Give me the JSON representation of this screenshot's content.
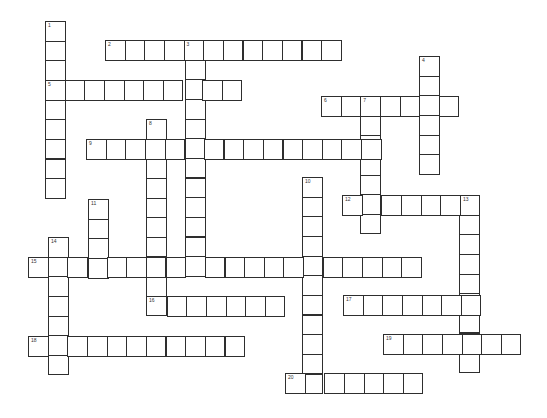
{
  "puzzle": {
    "cell_size": 19.65,
    "border_color": "#2e2e2e",
    "background": "#ffffff",
    "entries": [
      {
        "number": "1",
        "direction": "down",
        "x": 45,
        "y": 21,
        "length": 9
      },
      {
        "number": "2",
        "direction": "across",
        "x": 105,
        "y": 40,
        "length": 12
      },
      {
        "number": "3",
        "direction": "down",
        "x": 185,
        "y": 40,
        "length": 12
      },
      {
        "number": "4",
        "direction": "down",
        "x": 419,
        "y": 56,
        "length": 6
      },
      {
        "number": "5",
        "direction": "across",
        "x": 45,
        "y": 80,
        "length": 10
      },
      {
        "number": "6",
        "direction": "across",
        "x": 321,
        "y": 96,
        "length": 7
      },
      {
        "number": "7",
        "direction": "down",
        "x": 360,
        "y": 96,
        "length": 7
      },
      {
        "number": "8",
        "direction": "down",
        "x": 146,
        "y": 119,
        "length": 10
      },
      {
        "number": "9",
        "direction": "across",
        "x": 86,
        "y": 139,
        "length": 15
      },
      {
        "number": "10",
        "direction": "down",
        "x": 302,
        "y": 177,
        "length": 11
      },
      {
        "number": "11",
        "direction": "down",
        "x": 88,
        "y": 199,
        "length": 4
      },
      {
        "number": "12",
        "direction": "across",
        "x": 342,
        "y": 195,
        "length": 7
      },
      {
        "number": "13",
        "direction": "down",
        "x": 459,
        "y": 195,
        "length": 9
      },
      {
        "number": "14",
        "direction": "down",
        "x": 48,
        "y": 237,
        "length": 7
      },
      {
        "number": "15",
        "direction": "across",
        "x": 28,
        "y": 257,
        "length": 20
      },
      {
        "number": "16",
        "direction": "across",
        "x": 147,
        "y": 296,
        "length": 7
      },
      {
        "number": "17",
        "direction": "across",
        "x": 343,
        "y": 295,
        "length": 7
      },
      {
        "number": "18",
        "direction": "across",
        "x": 28,
        "y": 336,
        "length": 11
      },
      {
        "number": "19",
        "direction": "across",
        "x": 383,
        "y": 334,
        "length": 7
      },
      {
        "number": "20",
        "direction": "across",
        "x": 285,
        "y": 373,
        "length": 7
      }
    ]
  }
}
